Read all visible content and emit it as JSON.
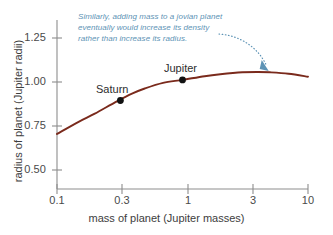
{
  "chart_data": {
    "type": "line",
    "title": "",
    "xlabel": "mass of planet (Jupiter masses)",
    "ylabel": "radius of planet (Jupiter radii)",
    "xscale": "log",
    "xlim": [
      0.1,
      10
    ],
    "ylim": [
      0.42,
      1.34
    ],
    "grid": false,
    "legend": null,
    "xticks": [
      {
        "value": 0.1,
        "label": "0.1"
      },
      {
        "value": 0.3,
        "label": "0.3"
      },
      {
        "value": 1,
        "label": "1"
      },
      {
        "value": 3,
        "label": "3"
      },
      {
        "value": 10,
        "label": "10"
      }
    ],
    "yticks": [
      {
        "value": 1.25,
        "label": "1.25"
      },
      {
        "value": 1.0,
        "label": "1.00"
      },
      {
        "value": 0.75,
        "label": "0.75"
      },
      {
        "value": 0.5,
        "label": "0.50"
      }
    ],
    "series": [
      {
        "name": "mass-radius relation for jovian planets",
        "color": "#7a2a1c",
        "x": [
          0.1,
          0.15,
          0.2,
          0.3,
          0.4,
          0.5,
          0.7,
          1.0,
          1.5,
          2.0,
          3.0,
          4.0,
          5.0,
          7.0,
          10.0
        ],
        "y": [
          0.705,
          0.775,
          0.82,
          0.89,
          0.935,
          0.963,
          0.995,
          1.012,
          1.033,
          1.044,
          1.055,
          1.057,
          1.055,
          1.047,
          1.03
        ]
      }
    ],
    "points": [
      {
        "name": "Saturn",
        "x": 0.32,
        "y": 0.895,
        "label": "Saturn"
      },
      {
        "name": "Jupiter",
        "x": 1.0,
        "y": 1.012,
        "label": "Jupiter"
      }
    ],
    "annotations": [
      {
        "name": "density-note",
        "color": "#5d93b5",
        "lines": [
          "Similarly, adding mass to a jovian planet",
          "eventually would increase its density",
          "rather than increase its radius."
        ],
        "arrow_target": {
          "x": 4.6,
          "y": 1.068
        }
      }
    ]
  }
}
